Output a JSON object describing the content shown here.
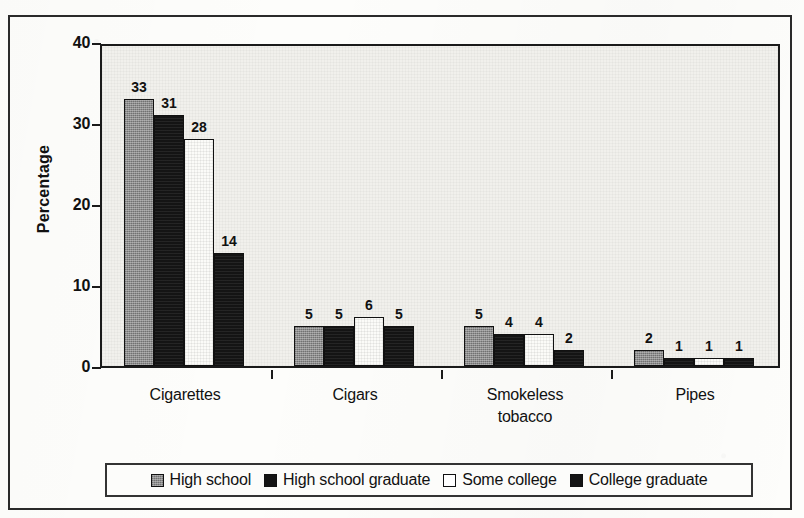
{
  "chart_data": {
    "type": "bar",
    "title": "",
    "xlabel": "",
    "ylabel": "Percentage",
    "ylim": [
      0,
      40
    ],
    "yticks": [
      0,
      10,
      20,
      30,
      40
    ],
    "ytick_labels": [
      "0",
      "10",
      "20",
      "30",
      "40"
    ],
    "grid": false,
    "legend_position": "bottom",
    "categories": [
      "Cigarettes",
      "Cigars",
      "Smokeless tobacco",
      "Pipes"
    ],
    "category_lines": [
      [
        "Cigarettes"
      ],
      [
        "Cigars"
      ],
      [
        "Smokeless",
        "tobacco"
      ],
      [
        "Pipes"
      ]
    ],
    "series": [
      {
        "name": "High school",
        "values": [
          33,
          5,
          5,
          2
        ],
        "swatch": "gray"
      },
      {
        "name": "High school graduate",
        "values": [
          31,
          5,
          4,
          1
        ],
        "swatch": "black"
      },
      {
        "name": "Some college",
        "values": [
          28,
          6,
          4,
          1
        ],
        "swatch": "white"
      },
      {
        "name": "College graduate",
        "values": [
          14,
          5,
          2,
          1
        ],
        "swatch": "black"
      }
    ]
  },
  "axis": {
    "y_title": "Percentage",
    "y_tick_labels": [
      "40",
      "30",
      "20",
      "10",
      "0"
    ]
  },
  "colors": {
    "series_gray": "#8d8d8d",
    "series_black": "#141414",
    "series_white": "#fbfbf8",
    "plot_background": "#f1f0ec",
    "frame": "#2a2a2a",
    "text": "#111111"
  },
  "legend": {
    "items": [
      {
        "label": "High school",
        "swatch": "gray"
      },
      {
        "label": "High school graduate",
        "swatch": "black"
      },
      {
        "label": "Some college",
        "swatch": "white"
      },
      {
        "label": "College graduate",
        "swatch": "black"
      }
    ]
  }
}
